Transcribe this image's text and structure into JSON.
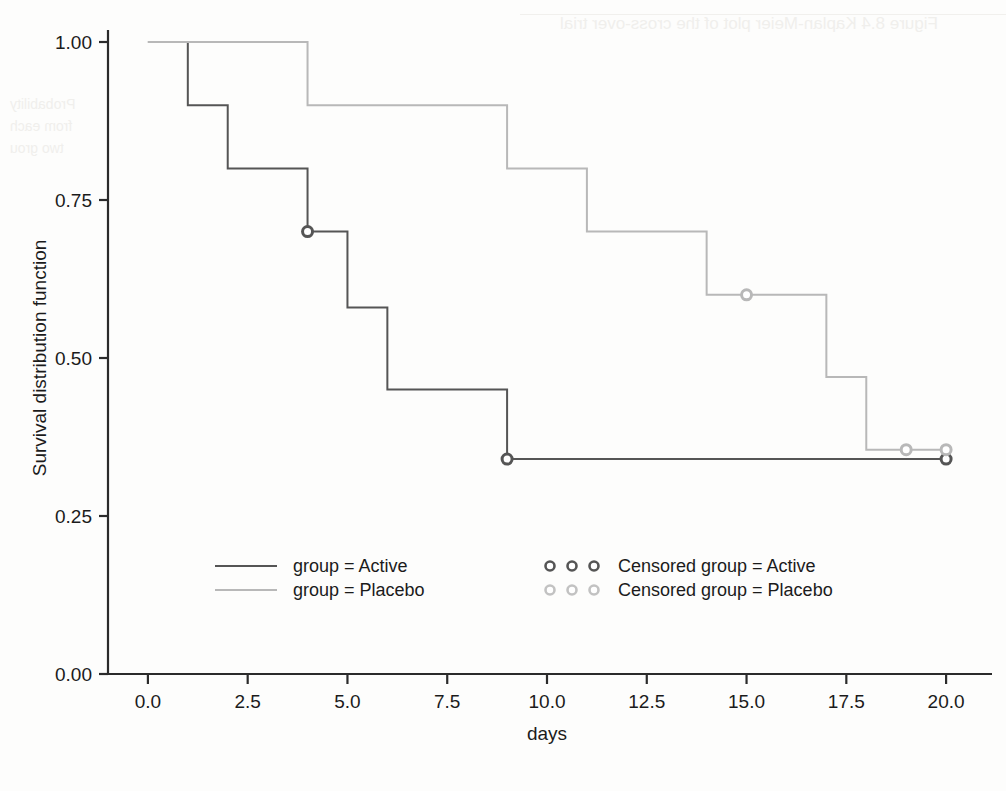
{
  "chart_data": {
    "type": "line",
    "title": "",
    "xlabel": "days",
    "ylabel": "Survival distribution function",
    "xlim": [
      -1.0,
      21.0
    ],
    "ylim": [
      0.0,
      1.04
    ],
    "xticks": [
      "0.0",
      "2.5",
      "5.0",
      "7.5",
      "10.0",
      "12.5",
      "15.0",
      "17.5",
      "20.0"
    ],
    "xtick_values": [
      0.0,
      2.5,
      5.0,
      7.5,
      10.0,
      12.5,
      15.0,
      17.5,
      20.0
    ],
    "yticks": [
      "0.00",
      "0.25",
      "0.50",
      "0.75",
      "1.00"
    ],
    "ytick_values": [
      0.0,
      0.25,
      0.5,
      0.75,
      1.0
    ],
    "grid": false,
    "step_type": "post",
    "legend_position": "lower center",
    "series": [
      {
        "name": "group = Active",
        "color": "#555555",
        "x": [
          0,
          1,
          2,
          4,
          5,
          6,
          9,
          20
        ],
        "y": [
          1.0,
          0.9,
          0.8,
          0.7,
          0.58,
          0.45,
          0.34,
          0.34
        ],
        "censored_x": [
          4,
          9,
          20
        ],
        "censored_y": [
          0.7,
          0.34,
          0.34
        ]
      },
      {
        "name": "group = Placebo",
        "color": "#b8b8b8",
        "x": [
          0,
          4,
          9,
          11,
          14,
          15,
          17,
          18,
          20
        ],
        "y": [
          1.0,
          0.9,
          0.8,
          0.7,
          0.6,
          0.6,
          0.47,
          0.355,
          0.355
        ],
        "censored_x": [
          15,
          19,
          20
        ],
        "censored_y": [
          0.6,
          0.355,
          0.355
        ]
      }
    ],
    "legend": [
      {
        "label": "group = Active",
        "marker": "line",
        "color": "#555555"
      },
      {
        "label": "group = Placebo",
        "marker": "line",
        "color": "#b8b8b8"
      },
      {
        "label": "Censored group = Active",
        "marker": "circle",
        "color": "#555555"
      },
      {
        "label": "Censored group = Placebo",
        "marker": "circle",
        "color": "#c2c2c2"
      }
    ]
  },
  "background_bleed": {
    "title": "Figure 8.4   Kaplan-Meier plot of the cross-over trial",
    "line1": "Probability",
    "line2": "from each",
    "line3": "two grou"
  }
}
